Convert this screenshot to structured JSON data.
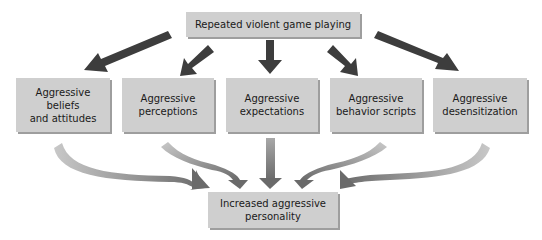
{
  "diagram": {
    "top": {
      "label": "Repeated violent game playing"
    },
    "middle": [
      {
        "label": "Aggressive beliefs\nand attitudes"
      },
      {
        "label": "Aggressive\nperceptions"
      },
      {
        "label": "Aggressive\nexpectations"
      },
      {
        "label": "Aggressive\nbehavior scripts"
      },
      {
        "label": "Aggressive\ndesensitization"
      }
    ],
    "bottom": {
      "label": "Increased aggressive\npersonality"
    }
  },
  "colors": {
    "box_fill": "#cfcfcf",
    "box_shadow": "#9e9e9e",
    "top_arrows": "#3d3d3d",
    "bottom_arrows_light": "#c4c4c4",
    "bottom_arrows_dark": "#6b6b6b"
  }
}
